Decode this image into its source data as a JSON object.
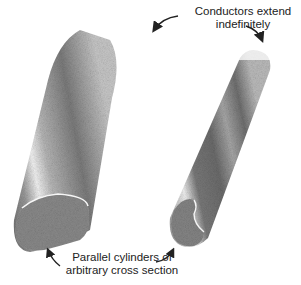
{
  "figure": {
    "annotations": {
      "top": {
        "line1": "Conductors extend",
        "line2": "indefinitely"
      },
      "bottom": {
        "line1": "Parallel cylinders of",
        "line2": "arbitrary cross section"
      }
    },
    "objects": [
      {
        "name": "left-conductor",
        "shape": "large rounded cylinder, end face at lower-left"
      },
      {
        "name": "right-conductor",
        "shape": "narrow cylinder with kidney-shaped cross-section, end face at lower-left"
      }
    ],
    "colors": {
      "background": "#ffffff",
      "shading_dark": "#5a5a5a",
      "shading_light": "#e8e8e8",
      "text": "#222222"
    }
  }
}
